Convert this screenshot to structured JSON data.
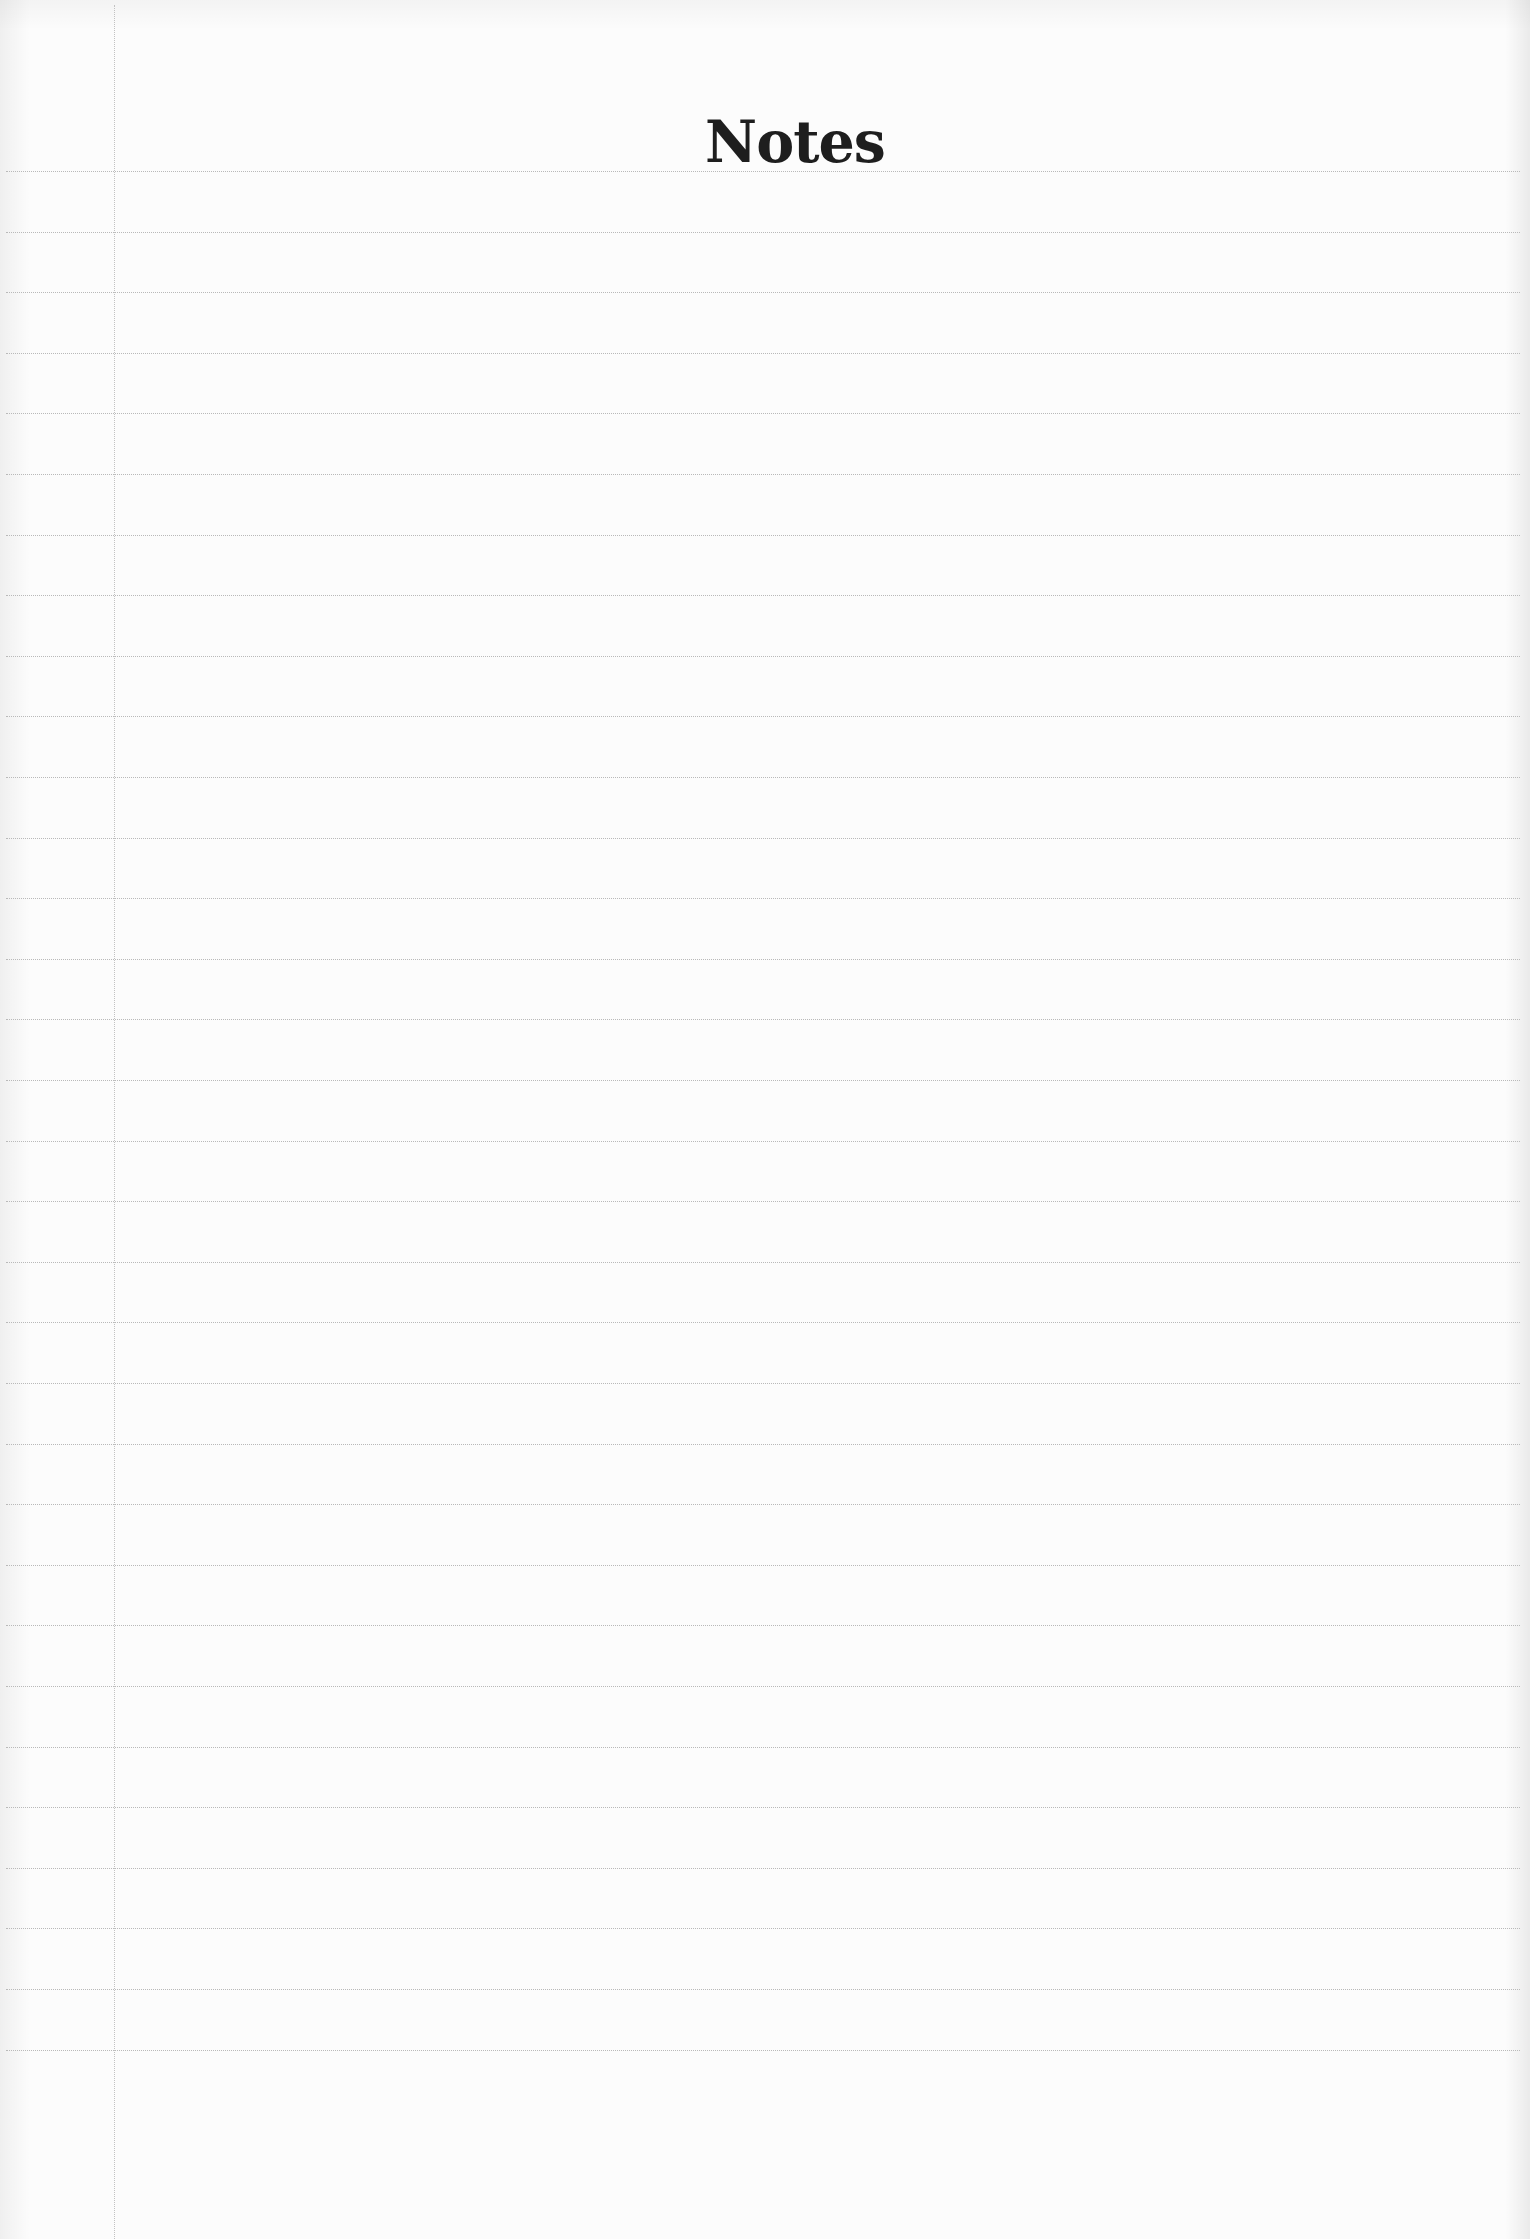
{
  "page": {
    "title": "Notes",
    "ruled_line_count": 32,
    "colors": {
      "paper": "#fcfcfc",
      "ink": "#1e1e1e",
      "rule": "#b9b9b9"
    }
  }
}
